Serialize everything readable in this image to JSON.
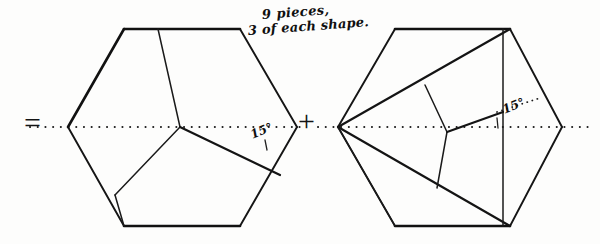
{
  "figure": {
    "background_color": "#fdfdfc",
    "ink_color": "#151515",
    "caption": {
      "line_1": "9 pieces,",
      "line_2": "3 of each shape."
    },
    "operators": {
      "equals": "=",
      "plus": "+"
    },
    "annotations": {
      "angle_left": "15°",
      "angle_right": "15°",
      "angle_value": 15,
      "angle_unit": "degrees"
    }
  },
  "left_figure": {
    "name": "left-hexagon",
    "piece_count": 3,
    "center": {
      "x": 180,
      "y": 127
    },
    "outline": [
      {
        "x": 68,
        "y": 127
      },
      {
        "x": 124,
        "y": 29
      },
      {
        "x": 240,
        "y": 29
      },
      {
        "x": 297,
        "y": 127
      },
      {
        "x": 240,
        "y": 226
      },
      {
        "x": 124,
        "y": 226
      }
    ],
    "hub": {
      "x": 180,
      "y": 127
    },
    "cuts": [
      {
        "from": {
          "x": 180,
          "y": 127
        },
        "to": {
          "x": 158,
          "y": 29
        }
      },
      {
        "from": {
          "x": 180,
          "y": 127
        },
        "to": {
          "x": 115,
          "y": 195
        }
      },
      {
        "from": {
          "x": 180,
          "y": 127
        },
        "to": {
          "x": 280,
          "y": 175
        }
      }
    ],
    "extra_cuts": [
      {
        "from": {
          "x": 115,
          "y": 195
        },
        "to": {
          "x": 124,
          "y": 226
        }
      }
    ],
    "axis": {
      "from": {
        "x": 30,
        "y": 127
      },
      "to": {
        "x": 300,
        "y": 127
      }
    },
    "angle_marker": {
      "vertex": {
        "x": 280,
        "y": 175
      },
      "ray_along_axis_to": {
        "x": 297,
        "y": 127
      },
      "label": "15°"
    }
  },
  "right_figure": {
    "name": "right-hexagon",
    "piece_count": 6,
    "center": {
      "x": 450,
      "y": 127
    },
    "outline": [
      {
        "x": 338,
        "y": 127
      },
      {
        "x": 395,
        "y": 29
      },
      {
        "x": 510,
        "y": 29
      },
      {
        "x": 562,
        "y": 127
      },
      {
        "x": 510,
        "y": 226
      },
      {
        "x": 395,
        "y": 226
      }
    ],
    "hub": {
      "x": 447,
      "y": 132
    },
    "fan_apex": {
      "x": 338,
      "y": 127
    },
    "cuts": [
      {
        "from": {
          "x": 338,
          "y": 127
        },
        "to": {
          "x": 510,
          "y": 29
        }
      },
      {
        "from": {
          "x": 338,
          "y": 127
        },
        "to": {
          "x": 510,
          "y": 226
        }
      },
      {
        "from": {
          "x": 338,
          "y": 127
        },
        "to": {
          "x": 395,
          "y": 226
        }
      },
      {
        "from": {
          "x": 447,
          "y": 132
        },
        "to": {
          "x": 425,
          "y": 85
        }
      },
      {
        "from": {
          "x": 447,
          "y": 132
        },
        "to": {
          "x": 503,
          "y": 112
        }
      },
      {
        "from": {
          "x": 447,
          "y": 132
        },
        "to": {
          "x": 437,
          "y": 188
        }
      }
    ],
    "vertical_chord": {
      "from": {
        "x": 503,
        "y": 29
      },
      "to": {
        "x": 503,
        "y": 226
      }
    },
    "axis": {
      "from": {
        "x": 318,
        "y": 127
      },
      "to": {
        "x": 585,
        "y": 127
      }
    },
    "angle_marker": {
      "vertex": {
        "x": 503,
        "y": 112
      },
      "ray_along_axis_to": {
        "x": 562,
        "y": 127
      },
      "label": "15°"
    }
  }
}
